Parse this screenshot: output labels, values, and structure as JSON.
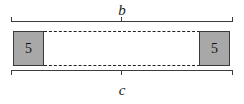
{
  "figure": {
    "type": "geometry-diagram",
    "background_color": "#ffffff",
    "stroke_color": "#3c3c3c",
    "square_fill_color": "#a8a8a8",
    "square_border_color": "#3a3a3a",
    "dashed_line_color": "#222222"
  },
  "dimensions": {
    "top": {
      "label": "b",
      "name": "dimension-b"
    },
    "bottom": {
      "label": "c",
      "name": "dimension-c"
    }
  },
  "end_squares": [
    {
      "position": "left",
      "value": "5"
    },
    {
      "position": "right",
      "value": "5"
    }
  ]
}
